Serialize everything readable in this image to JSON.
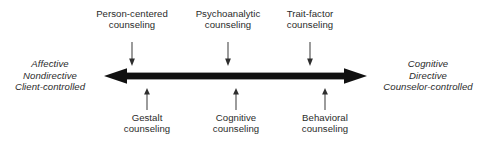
{
  "diagram": {
    "type": "double-headed-spectrum-arrow",
    "axis": {
      "orientation": "horizontal",
      "color": "#111111",
      "left_tip_x": 104,
      "right_tip_x": 367,
      "center_y": 76
    },
    "poles": {
      "left": {
        "line1": "Affective",
        "line2": "Nondirective",
        "line3": "Client-controlled"
      },
      "right": {
        "line1": "Cognitive",
        "line2": "Directive",
        "line3": "Counselor-controlled"
      }
    },
    "callouts_above": [
      {
        "line1": "Person-centered",
        "line2": "counseling",
        "pointer_x": 132
      },
      {
        "line1": "Psychoanalytic",
        "line2": "counseling",
        "pointer_x": 228
      },
      {
        "line1": "Trait-factor",
        "line2": "counseling",
        "pointer_x": 310
      }
    ],
    "callouts_below": [
      {
        "line1": "Gestalt",
        "line2": "counseling",
        "pointer_x": 147
      },
      {
        "line1": "Cognitive",
        "line2": "counseling",
        "pointer_x": 236
      },
      {
        "line1": "Behavioral",
        "line2": "counseling",
        "pointer_x": 325
      }
    ],
    "colors": {
      "text": "#2b2b2b",
      "arrow": "#111111",
      "pointer": "#555555",
      "background": "#ffffff"
    }
  }
}
